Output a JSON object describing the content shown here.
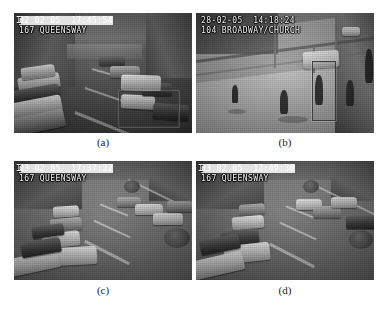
{
  "figure": {
    "type": "surveillance-frame-grid",
    "rows": 2,
    "columns": 2,
    "colorspace": "grayscale"
  },
  "panels": [
    {
      "id": "a",
      "caption": "(a)",
      "osd": {
        "icon": "camera-channel-icon",
        "line1": "02-02-05  17:45:54",
        "line1_visible": "02 02 05  17:45:54",
        "line2": "167 QUEENSWAY",
        "time": "17:45:54",
        "date": "02-02-05",
        "location": "167 QUEENSWAY"
      },
      "scene": "dusk city street with dense traffic queue and parked cars along left kerb",
      "detections": [
        {
          "label": "vehicle-detection-box",
          "x": 105,
          "y": 78,
          "w": 58,
          "h": 34
        }
      ]
    },
    {
      "id": "b",
      "caption": "(b)",
      "osd": {
        "icon": "camera-channel-icon",
        "line1": "28-02-05  14:18:24",
        "line1_visible": "28-02-05  14:18:24",
        "line2": "104 BROADWAY/CHURCH",
        "time": "14:18:24",
        "date": "28-02-05",
        "location": "104 BROADWAY/CHURCH"
      },
      "scene": "daytime wide pavement crossing with pedestrians and a white van",
      "detections": [
        {
          "label": "pedestrian-detection-box",
          "x": 116,
          "y": 48,
          "w": 22,
          "h": 58
        }
      ]
    },
    {
      "id": "c",
      "caption": "(c)",
      "osd": {
        "icon": "camera-channel-icon",
        "line1": "03-02-05  17:37:22",
        "line1_visible": "03 02 05  17:37:22",
        "line2": "167 QUEENSWAY",
        "time": "17:37:22",
        "date": "03-02-05",
        "location": "167 QUEENSWAY"
      },
      "scene": "daytime two-lane street with a long queue of stationary cars",
      "detections": []
    },
    {
      "id": "d",
      "caption": "(d)",
      "osd": {
        "icon": "camera-channel-icon",
        "line1": "03-02-05  17:49:30",
        "line1_visible": "03 02 05  17:49:30",
        "line2": "167 QUEENSWAY",
        "time": "17:49:30",
        "date": "03-02-05",
        "location": "167 QUEENSWAY"
      },
      "scene": "daytime two-lane street with queued cars, same camera as panel c",
      "detections": []
    }
  ],
  "colors": {
    "page_background": "#ffffff",
    "caption_text": "#1c1c1c",
    "osd_text": "#f2f2f2",
    "detection_box": "#3c3c3c"
  }
}
